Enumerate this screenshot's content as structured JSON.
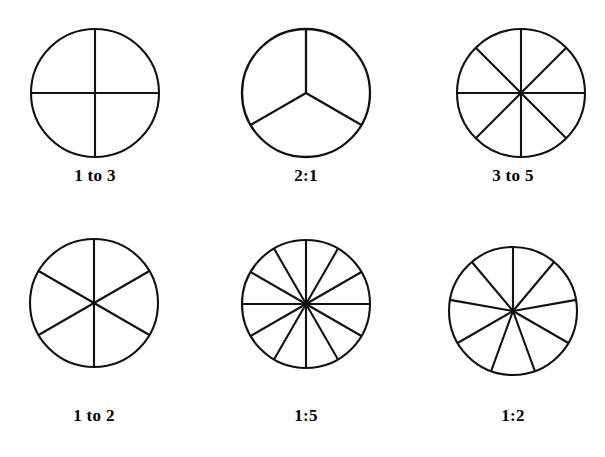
{
  "page": {
    "background_color": "#ffffff",
    "line_color": "#111111",
    "width": 605,
    "height": 457
  },
  "figures": [
    {
      "id": "figure-1",
      "label": "1 to 3",
      "sectors": 4,
      "center_x": 95,
      "center_y": 93,
      "radius": 64,
      "start_angle_deg": 90,
      "stroke_width": 2.1,
      "label_x": 95,
      "label_y": 166
    },
    {
      "id": "figure-2",
      "label": "2:1",
      "sectors": 3,
      "center_x": 306,
      "center_y": 93,
      "radius": 64,
      "start_angle_deg": 90,
      "stroke_width": 2.3,
      "label_x": 306,
      "label_y": 166
    },
    {
      "id": "figure-3",
      "label": "3 to 5",
      "sectors": 8,
      "center_x": 521,
      "center_y": 93,
      "radius": 64,
      "start_angle_deg": 90,
      "stroke_width": 2.1,
      "label_x": 513,
      "label_y": 166
    },
    {
      "id": "figure-4",
      "label": "1 to 2",
      "sectors": 6,
      "center_x": 94,
      "center_y": 303,
      "radius": 64,
      "start_angle_deg": 90,
      "stroke_width": 2.1,
      "label_x": 94,
      "label_y": 406
    },
    {
      "id": "figure-5",
      "label": "1:5",
      "sectors": 12,
      "center_x": 306,
      "center_y": 304,
      "radius": 64,
      "start_angle_deg": 90,
      "stroke_width": 2.1,
      "label_x": 306,
      "label_y": 406
    },
    {
      "id": "figure-6",
      "label": "1:2",
      "sectors": 9,
      "center_x": 513,
      "center_y": 311,
      "radius": 64,
      "start_angle_deg": 90,
      "stroke_width": 2.1,
      "label_x": 513,
      "label_y": 406
    }
  ],
  "chart_data": {
    "type": "pie",
    "title": "",
    "xlabel": "",
    "ylabel": "",
    "charts": [
      {
        "label": "1 to 3",
        "equal_parts": 4,
        "slice_angle_deg": 90,
        "values": [
          25,
          25,
          25,
          25
        ]
      },
      {
        "label": "2:1",
        "equal_parts": 3,
        "slice_angle_deg": 120,
        "values": [
          33.3,
          33.3,
          33.3
        ]
      },
      {
        "label": "3 to 5",
        "equal_parts": 8,
        "slice_angle_deg": 45,
        "values": [
          12.5,
          12.5,
          12.5,
          12.5,
          12.5,
          12.5,
          12.5,
          12.5
        ]
      },
      {
        "label": "1 to 2",
        "equal_parts": 6,
        "slice_angle_deg": 60,
        "values": [
          16.7,
          16.7,
          16.7,
          16.7,
          16.7,
          16.7
        ]
      },
      {
        "label": "1:5",
        "equal_parts": 12,
        "slice_angle_deg": 30,
        "values": [
          8.3,
          8.3,
          8.3,
          8.3,
          8.3,
          8.3,
          8.3,
          8.3,
          8.3,
          8.3,
          8.3,
          8.3
        ]
      },
      {
        "label": "1:2",
        "equal_parts": 9,
        "slice_angle_deg": 40,
        "values": [
          11.1,
          11.1,
          11.1,
          11.1,
          11.1,
          11.1,
          11.1,
          11.1,
          11.1
        ]
      }
    ]
  }
}
